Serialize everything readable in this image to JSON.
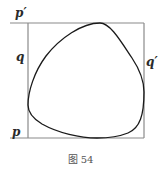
{
  "figure": {
    "labels": {
      "p_prime": "p′",
      "q": "q",
      "q_prime": "q′",
      "p": "p"
    },
    "caption": "图 54",
    "colors": {
      "square": "#8a8a8a",
      "curve": "#1a1a1a"
    }
  }
}
